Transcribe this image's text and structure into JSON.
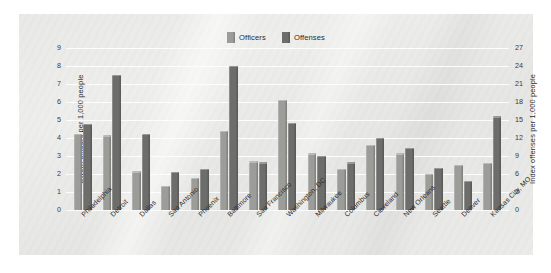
{
  "chart_data": {
    "type": "bar",
    "title": "",
    "subtitle": "",
    "grid": true,
    "legend_position": "top-center",
    "categories": [
      "Philadelphia",
      "Detroit",
      "Dallas",
      "San Antonio",
      "Phoenix",
      "Baltimore",
      "San Francisco",
      "Washington, DC",
      "Milwaukee",
      "Columbus",
      "Cleveland",
      "New Orleans",
      "Seattle",
      "Denver",
      "Kansas City, MO"
    ],
    "series": [
      {
        "name": "Officers",
        "axis": "left",
        "unit": "Sworn officers per 1,000 people",
        "color": "#9c9c99",
        "values": [
          4.25,
          4.15,
          2.15,
          1.35,
          1.8,
          4.4,
          2.7,
          6.1,
          3.15,
          2.3,
          3.6,
          3.15,
          2.0,
          2.5,
          2.6
        ]
      },
      {
        "name": "Offenses",
        "axis": "right",
        "unit": "Index offenses per 1,000 people",
        "color": "#6d6d6b",
        "values_left_scale": [
          4.8,
          7.5,
          4.25,
          2.1,
          2.3,
          8.0,
          2.65,
          4.85,
          3.0,
          2.65,
          4.0,
          3.45,
          2.35,
          1.6,
          5.2
        ],
        "values": [
          14.4,
          22.5,
          12.75,
          6.3,
          6.9,
          24.0,
          7.95,
          14.55,
          9.0,
          7.95,
          12.0,
          10.35,
          7.05,
          4.8,
          15.6
        ]
      }
    ],
    "xlabel": "",
    "ylabel_left": "Sworn officers per 1,000 people",
    "ylabel_right": "Index offenses per 1,000 people",
    "ylim_left": [
      0,
      9
    ],
    "ylim_right": [
      0,
      27
    ],
    "yticks_left": [
      "0",
      "1",
      "2",
      "3",
      "4",
      "5",
      "6",
      "7",
      "8",
      "9"
    ],
    "yticks_right": [
      "0",
      "3",
      "6",
      "9",
      "12",
      "15",
      "18",
      "21",
      "24",
      "27"
    ]
  },
  "legend": {
    "items": [
      {
        "label": "Officers",
        "color": "#9c9c99",
        "swatch_name": "legend-swatch-officers"
      },
      {
        "label": "Offenses",
        "color": "#6d6d6b",
        "swatch_name": "legend-swatch-offenses"
      }
    ]
  },
  "colors": {
    "officers": "#9c9c99",
    "offenses": "#6d6d6b",
    "panel_background": "#eaeae8",
    "gridline": "#fdfdfd",
    "text": "#2b2b29",
    "page_background": "#ffffff"
  }
}
